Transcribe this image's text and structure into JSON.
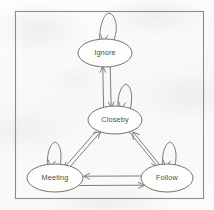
{
  "diagram": {
    "style": "hand-drawn scanned sketch",
    "frame": {
      "name": "outer-border",
      "x": 15,
      "y": 11,
      "width": 189,
      "height": 188,
      "stroke": "#8d8d8f",
      "stroke_width": 1.1
    },
    "colors": {
      "background": "#fcfcfb",
      "stroke": "#6f6f71",
      "node_stroke": "#6b6b6d",
      "node_fill": "none",
      "label_text": "#4e4e50"
    },
    "nodes": [
      {
        "id": "ignore",
        "label": "Ignore",
        "cx": 105,
        "cy": 53,
        "rx": 27,
        "ry": 14
      },
      {
        "id": "closeby",
        "label": "Closeby",
        "cx": 115,
        "cy": 120,
        "rx": 27,
        "ry": 14
      },
      {
        "id": "meeting",
        "label": "Meeting",
        "cx": 55,
        "cy": 178,
        "rx": 28,
        "ry": 14
      },
      {
        "id": "follow",
        "label": "Follow",
        "cx": 167,
        "cy": 178,
        "rx": 26,
        "ry": 14
      }
    ],
    "self_loops": [
      {
        "id": "ignore-self",
        "node": "ignore",
        "label": "",
        "apex_x": 109,
        "apex_y": 13
      },
      {
        "id": "closeby-self",
        "node": "closeby",
        "label": "",
        "apex_x": 126,
        "apex_y": 84
      },
      {
        "id": "meeting-self",
        "node": "meeting",
        "label": "",
        "apex_x": 55,
        "apex_y": 142
      },
      {
        "id": "follow-self",
        "node": "follow",
        "label": "",
        "apex_x": 170,
        "apex_y": 142
      }
    ],
    "edges": [
      {
        "id": "closeby-to-ignore",
        "from": "closeby",
        "to": "ignore",
        "label": "",
        "arrow": "up"
      },
      {
        "id": "ignore-to-closeby",
        "from": "ignore",
        "to": "closeby",
        "label": "",
        "arrow": "down"
      },
      {
        "id": "meeting-to-closeby",
        "from": "meeting",
        "to": "closeby",
        "label": "",
        "arrow": "up-right"
      },
      {
        "id": "closeby-to-meeting",
        "from": "closeby",
        "to": "meeting",
        "label": "",
        "arrow": "down-left"
      },
      {
        "id": "closeby-to-follow",
        "from": "closeby",
        "to": "follow",
        "label": "",
        "arrow": "down-right"
      },
      {
        "id": "follow-to-closeby",
        "from": "follow",
        "to": "closeby",
        "label": "",
        "arrow": "up-left"
      },
      {
        "id": "follow-to-meeting",
        "from": "follow",
        "to": "meeting",
        "label": "",
        "arrow": "left"
      },
      {
        "id": "meeting-to-follow",
        "from": "meeting",
        "to": "follow",
        "label": "",
        "arrow": "right"
      }
    ]
  }
}
